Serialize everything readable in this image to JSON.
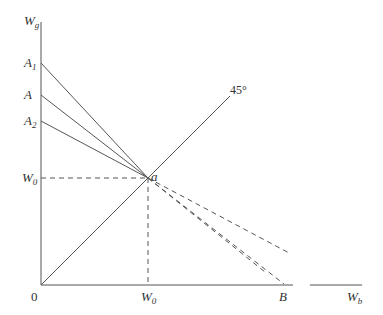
{
  "diagram": {
    "axes": {
      "y_label": "W",
      "y_label_sub": "g",
      "x_label": "W",
      "x_label_sub": "b",
      "origin": "0"
    },
    "y_ticks": [
      {
        "id": "A1",
        "text": "A",
        "sub": "1"
      },
      {
        "id": "A",
        "text": "A",
        "sub": ""
      },
      {
        "id": "A2",
        "text": "A",
        "sub": "2"
      },
      {
        "id": "W0y",
        "text": "W",
        "sub": "0"
      }
    ],
    "x_ticks": [
      {
        "id": "W0x",
        "text": "W",
        "sub": "0"
      },
      {
        "id": "B",
        "text": "B",
        "sub": ""
      }
    ],
    "point_label": "a",
    "angle_label": "45°",
    "colors": {
      "line": "#555555",
      "text": "#333333"
    }
  }
}
